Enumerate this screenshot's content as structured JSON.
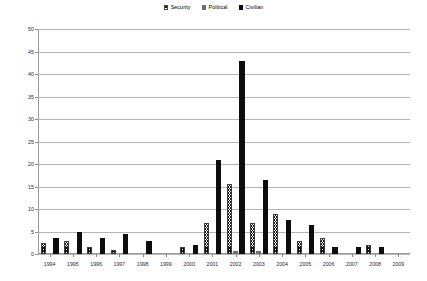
{
  "legend": {
    "position": "top-center",
    "entries": [
      {
        "label": "Security",
        "icon": "hatch-swatch-icon",
        "color": "#111111"
      },
      {
        "label": "Political",
        "icon": "gray-swatch-icon",
        "color": "#6f6f6f"
      },
      {
        "label": "Civilian",
        "icon": "black-swatch-icon",
        "color": "#0d0d0d"
      }
    ]
  },
  "chart_data": {
    "type": "bar",
    "title": "",
    "subtitle": "",
    "xlabel": "",
    "ylabel": "",
    "ylim": [
      0,
      50
    ],
    "yticks": [
      0,
      5,
      10,
      15,
      20,
      25,
      30,
      35,
      40,
      45,
      50
    ],
    "grid": true,
    "legend_position": "top-center",
    "categories": [
      "1994",
      "1995",
      "1996",
      "1997",
      "1998",
      "1999",
      "2000",
      "2001",
      "2002",
      "2003",
      "2004",
      "2005",
      "2006",
      "2007",
      "2008",
      "2009"
    ],
    "series": [
      {
        "name": "Security",
        "color": "#111111",
        "pattern": "cross-hatch",
        "values": [
          2.5,
          3,
          1.5,
          1,
          0,
          0,
          1.5,
          7,
          15.5,
          7,
          9,
          3,
          3.5,
          0,
          2,
          0
        ]
      },
      {
        "name": "Political",
        "color": "#6f6f6f",
        "pattern": "solid-gray",
        "values": [
          0,
          0,
          0,
          0,
          0,
          0,
          0,
          0,
          0.7,
          0.7,
          0,
          0,
          0,
          0,
          0,
          0
        ]
      },
      {
        "name": "Civilian",
        "color": "#0d0d0d",
        "pattern": "solid-black",
        "values": [
          3.5,
          5,
          3.5,
          4.5,
          3,
          0,
          2,
          21,
          43,
          16.5,
          7.5,
          6.5,
          1.5,
          1.5,
          1.5,
          0
        ]
      }
    ]
  }
}
